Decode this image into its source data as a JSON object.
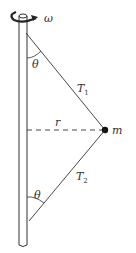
{
  "figure": {
    "labels": {
      "omega": "ω",
      "theta_top": "θ",
      "theta_bottom": "θ",
      "tension_upper": "T",
      "tension_upper_sub": "1",
      "tension_lower": "T",
      "tension_lower_sub": "2",
      "radius": "r",
      "mass": "m"
    },
    "colors": {
      "line": "#333333",
      "background": "#ffffff"
    }
  }
}
